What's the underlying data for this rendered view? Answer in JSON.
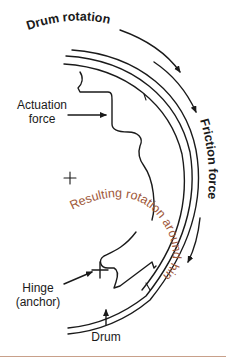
{
  "diagram": {
    "labels": {
      "drum_rotation": "Drum rotation",
      "friction_force": "Friction force",
      "actuation_force_line1": "Actuation",
      "actuation_force_line2": "force",
      "resulting_rotation": "Resulting rotation around hinge",
      "hinge_line1": "Hinge",
      "hinge_line2": "(anchor)",
      "drum": "Drum"
    },
    "colors": {
      "line": "#1a1a1a",
      "accent_text": "#a0583a",
      "rule": "#c8a08a",
      "background": "#ffffff"
    },
    "markers": {
      "center_mark": "+",
      "hinge_mark": "+"
    }
  }
}
